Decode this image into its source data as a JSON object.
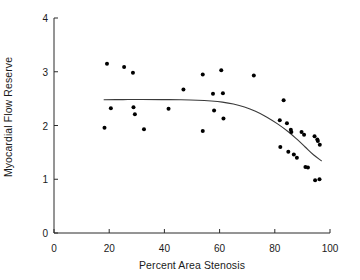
{
  "chart_data": {
    "type": "scatter",
    "title": "",
    "xlabel": "Percent Area Stenosis",
    "ylabel": "Myocardial Flow Reserve",
    "xlim": [
      0,
      100
    ],
    "ylim": [
      0,
      4
    ],
    "xticks": [
      0,
      20,
      40,
      60,
      80,
      100
    ],
    "yticks": [
      0,
      1,
      2,
      3,
      4
    ],
    "grid": false,
    "legend": null,
    "marker": {
      "shape": "circle",
      "color": "#000000",
      "size": 3.4
    },
    "points": [
      {
        "x": 18.3,
        "y": 1.96
      },
      {
        "x": 19.2,
        "y": 3.15
      },
      {
        "x": 20.6,
        "y": 2.32
      },
      {
        "x": 25.4,
        "y": 3.09
      },
      {
        "x": 28.6,
        "y": 2.98
      },
      {
        "x": 28.8,
        "y": 2.34
      },
      {
        "x": 29.3,
        "y": 2.21
      },
      {
        "x": 32.6,
        "y": 1.93
      },
      {
        "x": 41.5,
        "y": 2.31
      },
      {
        "x": 46.9,
        "y": 2.67
      },
      {
        "x": 53.9,
        "y": 2.95
      },
      {
        "x": 53.9,
        "y": 1.9
      },
      {
        "x": 57.6,
        "y": 2.59
      },
      {
        "x": 58.0,
        "y": 2.28
      },
      {
        "x": 60.6,
        "y": 3.03
      },
      {
        "x": 61.2,
        "y": 2.6
      },
      {
        "x": 61.4,
        "y": 2.13
      },
      {
        "x": 72.4,
        "y": 2.93
      },
      {
        "x": 81.8,
        "y": 2.1
      },
      {
        "x": 82.0,
        "y": 1.6
      },
      {
        "x": 83.2,
        "y": 2.47
      },
      {
        "x": 84.4,
        "y": 2.04
      },
      {
        "x": 84.9,
        "y": 1.51
      },
      {
        "x": 85.8,
        "y": 1.92
      },
      {
        "x": 86.0,
        "y": 1.88
      },
      {
        "x": 86.9,
        "y": 1.46
      },
      {
        "x": 88.0,
        "y": 1.4
      },
      {
        "x": 89.7,
        "y": 1.88
      },
      {
        "x": 90.6,
        "y": 1.83
      },
      {
        "x": 91.1,
        "y": 1.23
      },
      {
        "x": 92.0,
        "y": 1.22
      },
      {
        "x": 94.4,
        "y": 1.8
      },
      {
        "x": 94.6,
        "y": 0.98
      },
      {
        "x": 95.4,
        "y": 1.74
      },
      {
        "x": 95.6,
        "y": 1.71
      },
      {
        "x": 96.2,
        "y": 1.0
      },
      {
        "x": 96.3,
        "y": 1.64
      }
    ],
    "fit_curve": {
      "style": "solid",
      "color": "#3a3a3a",
      "width": 1.1,
      "points": [
        {
          "x": 18.0,
          "y": 2.48
        },
        {
          "x": 25.0,
          "y": 2.482
        },
        {
          "x": 32.0,
          "y": 2.483
        },
        {
          "x": 39.0,
          "y": 2.482
        },
        {
          "x": 46.0,
          "y": 2.478
        },
        {
          "x": 52.0,
          "y": 2.47
        },
        {
          "x": 57.0,
          "y": 2.455
        },
        {
          "x": 61.0,
          "y": 2.435
        },
        {
          "x": 65.0,
          "y": 2.4
        },
        {
          "x": 69.0,
          "y": 2.345
        },
        {
          "x": 73.0,
          "y": 2.265
        },
        {
          "x": 77.0,
          "y": 2.16
        },
        {
          "x": 81.0,
          "y": 2.03
        },
        {
          "x": 85.0,
          "y": 1.88
        },
        {
          "x": 88.0,
          "y": 1.745
        },
        {
          "x": 91.0,
          "y": 1.6
        },
        {
          "x": 94.0,
          "y": 1.455
        },
        {
          "x": 97.0,
          "y": 1.34
        }
      ]
    }
  },
  "axis": {
    "x_tick_labels": [
      "0",
      "20",
      "40",
      "60",
      "80",
      "100"
    ],
    "y_tick_labels": [
      "0",
      "1",
      "2",
      "3",
      "4"
    ]
  }
}
